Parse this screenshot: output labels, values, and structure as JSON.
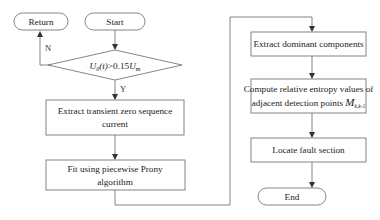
{
  "diagram": {
    "type": "flowchart",
    "nodes": {
      "return": {
        "label": "Return",
        "shape": "terminal"
      },
      "start": {
        "label": "Start",
        "shape": "terminal"
      },
      "decision": {
        "shape": "diamond",
        "label_parts": {
          "u": "U",
          "sub0": "0",
          "t": "(t)",
          "op": ">0.15",
          "u2": "U",
          "subm": "m"
        },
        "label_plain": "U0(t)>0.15Um"
      },
      "extract_transient": {
        "line1": "Extract transient zero sequence",
        "line2": "current"
      },
      "fit_prony": {
        "line1": "Fit using piecewise Prony",
        "line2": "algorithm"
      },
      "extract_dominant": {
        "label": "Extract dominant components"
      },
      "compute_entropy": {
        "line1": "Compute relative entropy values of",
        "line2": "adjacent detection points ",
        "symbol": "M",
        "symbol_sub": "k,k-1"
      },
      "locate_fault": {
        "label": "Locate fault section"
      },
      "end": {
        "label": "End",
        "shape": "terminal"
      }
    },
    "edge_labels": {
      "no": "N",
      "yes": "Y"
    },
    "edges": [
      [
        "start",
        "decision"
      ],
      [
        "decision",
        "return",
        "N"
      ],
      [
        "decision",
        "extract_transient",
        "Y"
      ],
      [
        "extract_transient",
        "fit_prony"
      ],
      [
        "fit_prony",
        "extract_dominant"
      ],
      [
        "extract_dominant",
        "compute_entropy"
      ],
      [
        "compute_entropy",
        "locate_fault"
      ],
      [
        "locate_fault",
        "end"
      ]
    ],
    "colors": {
      "stroke": "#777777",
      "arrow": "#333333",
      "text": "#222222",
      "background": "#ffffff"
    }
  }
}
